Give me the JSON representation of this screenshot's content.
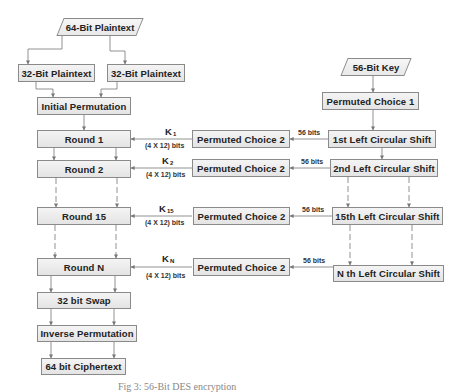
{
  "diagram": {
    "type": "flowchart",
    "title": "DES encryption",
    "left_column": {
      "input": "64-Bit Plaintext",
      "split": [
        "32-Bit Plaintext",
        "32-Bit Plaintext"
      ],
      "initial_permutation": "Initial Permutation",
      "rounds": [
        "Round 1",
        "Round 2",
        "Round 15",
        "Round N"
      ],
      "swap": "32 bit Swap",
      "inverse_permutation": "Inverse Permutation",
      "output": "64 bit Ciphertext"
    },
    "right_column": {
      "input": "56-Bit Key",
      "permuted_choice_1": "Permuted Choice 1",
      "shifts": [
        "1st Left Circular Shift",
        "2nd Left Circular Shift",
        "15th Left Circular Shift",
        "N th Left Circular Shift"
      ]
    },
    "middle_column": {
      "permuted_choice_2": [
        "Permuted Choice 2",
        "Permuted Choice 2",
        "Permuted Choice 2",
        "Permuted Choice 2"
      ],
      "shift_to_pc2_label": [
        "56 bits",
        "56 bits",
        "56 bits",
        "56 bits"
      ],
      "subkeys": [
        {
          "k": "K",
          "sub": "1",
          "size": "(4 X 12) bits"
        },
        {
          "k": "K",
          "sub": "2",
          "size": "(4 X 12) bits"
        },
        {
          "k": "K",
          "sub": "15",
          "size": "(4 X 12) bits"
        },
        {
          "k": "K",
          "sub": "N",
          "size": "(4 X 12) bits"
        }
      ]
    },
    "caption": "Fig 3: 56-Bit DES encryption"
  },
  "colors": {
    "box_border": "#8a8a8a",
    "box_fill": "#ececec",
    "line": "#777777",
    "text": "#222222"
  }
}
